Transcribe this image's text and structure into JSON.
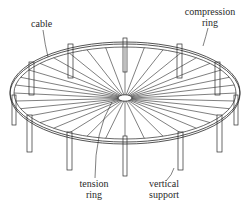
{
  "diagram": {
    "labels": {
      "cable": "cable",
      "compression_ring_line1": "compression",
      "compression_ring_line2": "ring",
      "tension_ring_line1": "tension",
      "tension_ring_line2": "ring",
      "vertical_support_line1": "vertical",
      "vertical_support_line2": "support"
    },
    "colors": {
      "line": "#2a2a2a",
      "fill": "#ffffff"
    },
    "counts": {
      "radial_cables": 36,
      "vertical_supports_front": 7,
      "vertical_supports_back": 5
    }
  }
}
